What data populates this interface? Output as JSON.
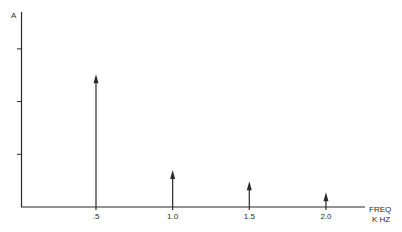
{
  "chart_data": {
    "type": "bar",
    "subtype": "spectrum-arrows",
    "title": "",
    "ylabel": "A",
    "xlabel": [
      "FREQ",
      "K HZ"
    ],
    "categories": [
      ".5",
      "1.0",
      "1.5",
      "2.0"
    ],
    "x": [
      0.5,
      1.0,
      1.5,
      2.0
    ],
    "values": [
      2.52,
      0.7,
      0.49,
      0.28
    ],
    "y_ticks_count": 3,
    "y_tick_labels": [],
    "ylim": [
      0,
      3.7
    ],
    "grid": false,
    "legend": null
  },
  "colors": {
    "ink": "#2a2a2a",
    "background": "#ffffff"
  }
}
